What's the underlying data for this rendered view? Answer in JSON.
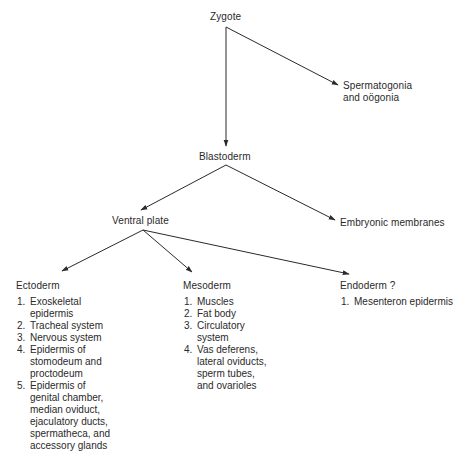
{
  "diagram": {
    "nodes": {
      "zygote": "Zygote",
      "germ_cells_line1": "Spermatogonia",
      "germ_cells_line2": "and oögonia",
      "blastoderm": "Blastoderm",
      "ventral_plate": "Ventral plate",
      "embryonic_membranes": "Embryonic membranes",
      "ectoderm": "Ectoderm",
      "mesoderm": "Mesoderm",
      "endoderm": "Endoderm ?"
    },
    "ectoderm_derivatives": [
      {
        "num": "1.",
        "lines": [
          "Exoskeletal",
          "epidermis"
        ]
      },
      {
        "num": "2.",
        "lines": [
          "Tracheal system"
        ]
      },
      {
        "num": "3.",
        "lines": [
          "Nervous system"
        ]
      },
      {
        "num": "4.",
        "lines": [
          "Epidermis of",
          "stomodeum and",
          "proctodeum"
        ]
      },
      {
        "num": "5.",
        "lines": [
          "Epidermis of",
          "genital chamber,",
          "median oviduct,",
          "ejaculatory ducts,",
          "spermatheca, and",
          "accessory glands"
        ]
      }
    ],
    "mesoderm_derivatives": [
      {
        "num": "1.",
        "lines": [
          "Muscles"
        ]
      },
      {
        "num": "2.",
        "lines": [
          "Fat body"
        ]
      },
      {
        "num": "3.",
        "lines": [
          "Circulatory",
          "system"
        ]
      },
      {
        "num": "4.",
        "lines": [
          "Vas deferens,",
          "lateral oviducts,",
          "sperm tubes,",
          "and ovarioles"
        ]
      }
    ],
    "endoderm_derivatives": [
      {
        "num": "1.",
        "lines": [
          "Mesenteron epidermis"
        ]
      }
    ],
    "edges": [
      {
        "from": "Zygote",
        "to": "Blastoderm"
      },
      {
        "from": "Zygote",
        "to": "Spermatogonia and oögonia"
      },
      {
        "from": "Blastoderm",
        "to": "Ventral plate"
      },
      {
        "from": "Blastoderm",
        "to": "Embryonic membranes"
      },
      {
        "from": "Ventral plate",
        "to": "Ectoderm"
      },
      {
        "from": "Ventral plate",
        "to": "Mesoderm"
      },
      {
        "from": "Ventral plate",
        "to": "Endoderm ?"
      }
    ],
    "colors": {
      "line": "#2a2a2a",
      "text": "#2a2a2a",
      "background": "#ffffff"
    }
  }
}
